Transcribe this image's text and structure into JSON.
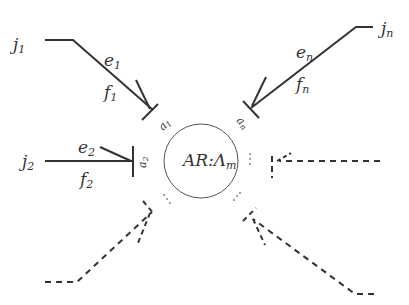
{
  "diagram": {
    "type": "agent-relation-diagram",
    "center": {
      "label": "AR:Λ",
      "subscript": "m"
    },
    "ports": [
      {
        "name": "a",
        "subscript": "1"
      },
      {
        "name": "a",
        "subscript": "2"
      },
      {
        "name": "a",
        "subscript": "n"
      }
    ],
    "agents": [
      {
        "name": "j",
        "subscript": "1",
        "edge_top": {
          "name": "e",
          "subscript": "1"
        },
        "edge_bottom": {
          "name": "f",
          "subscript": "1"
        }
      },
      {
        "name": "j",
        "subscript": "2",
        "edge_top": {
          "name": "e",
          "subscript": "2"
        },
        "edge_bottom": {
          "name": "f",
          "subscript": "2"
        }
      },
      {
        "name": "j",
        "subscript": "n",
        "edge_top": {
          "name": "e",
          "subscript": "n"
        },
        "edge_bottom": {
          "name": "f",
          "subscript": "n"
        }
      }
    ],
    "ellipsis": "…",
    "colors": {
      "stroke": "#333333",
      "circle": "#555555",
      "background": "#ffffff"
    }
  }
}
